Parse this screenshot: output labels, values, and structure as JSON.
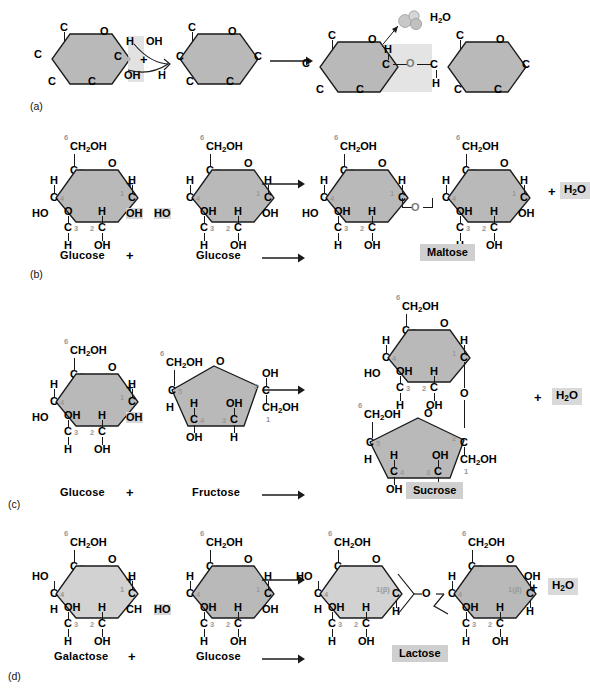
{
  "figure": {
    "panels": [
      "a",
      "b",
      "c",
      "d"
    ],
    "water_label": "H2O",
    "plus": "+",
    "arrow": "→"
  },
  "labels": {
    "a": "(a)",
    "b": "(b)",
    "c": "(c)",
    "d": "(d)"
  },
  "atoms": {
    "C": "C",
    "O": "O",
    "H": "H",
    "OH": "OH",
    "HO": "HO",
    "CH2OH": "CH2OH",
    "CH": "CH",
    "water": "H2O"
  },
  "carbon_numbers": [
    "1",
    "2",
    "3",
    "4",
    "5",
    "6"
  ],
  "beta_label": "1(β)",
  "panel_a": {
    "label": "(a)",
    "left_ring": {
      "top_c": "C",
      "ring_o": "O",
      "right_c": "C",
      "left_c": "C",
      "bottom_left_c": "C",
      "bottom_right_c": "C",
      "h": "H",
      "oh": "OH"
    },
    "right_ring": {
      "top_c": "C",
      "ring_o": "O",
      "left_c": "C",
      "right_c": "C",
      "bottom_left_c": "C",
      "bottom_right_c": "C",
      "oh": "OH",
      "h": "H"
    },
    "plus": "+",
    "arrow": "→",
    "product": {
      "left_c": "C",
      "bridge_o": "O",
      "right_c": "C",
      "h_top": "H",
      "h_bottom": "H"
    },
    "released_water": "H2O"
  },
  "panel_b": {
    "label": "(b)",
    "reactant_1": "Glucose",
    "reactant_2": "Glucose",
    "plus": "+",
    "arrow": "→",
    "product": "Maltose",
    "byproduct": "H2O",
    "product_plus": "+"
  },
  "panel_c": {
    "label": "(c)",
    "reactant_1": "Glucose",
    "reactant_2": "Fructose",
    "plus": "+",
    "arrow": "→",
    "product": "Sucrose",
    "byproduct": "H2O",
    "product_plus": "+"
  },
  "panel_d": {
    "label": "(d)",
    "reactant_1": "Galactose",
    "reactant_2": "Glucose",
    "plus": "+",
    "arrow": "→",
    "product": "Lactose",
    "byproduct": "H2O",
    "product_plus": "+"
  },
  "colors": {
    "ring_fill_dark": "#b9b9b9",
    "ring_fill_light": "#d2d2d2",
    "highlight": "#d8d8d8",
    "bond": "#1a1a1a",
    "number": "#9a9a9a",
    "background": "#ffffff"
  }
}
